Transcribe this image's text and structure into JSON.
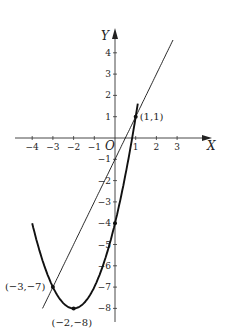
{
  "chart_data": {
    "type": "line",
    "title": "",
    "xlabel": "X",
    "ylabel": "Y",
    "origin_label": "O",
    "xlim": [
      -4,
      3
    ],
    "ylim": [
      -8,
      4
    ],
    "x_ticks": [
      "-4",
      "-3",
      "-2",
      "-1",
      "1",
      "2",
      "3"
    ],
    "y_ticks": [
      "4",
      "3",
      "2",
      "1",
      "-1",
      "-2",
      "-3",
      "-4",
      "-5",
      "-6",
      "-7",
      "-8"
    ],
    "grid": false,
    "series": [
      {
        "name": "parabola",
        "equation": "y = x^2 + 4x - 4",
        "style": "thick",
        "x_range": [
          -4.0,
          1.1
        ]
      },
      {
        "name": "line",
        "equation": "y = 2x - 1",
        "style": "thin",
        "x_range": [
          -3.5,
          2.8
        ]
      }
    ],
    "points": [
      {
        "x": 1,
        "y": 1,
        "label": "(1,1)"
      },
      {
        "x": -3,
        "y": -7,
        "label": "(−3,−7)"
      },
      {
        "x": -2,
        "y": -8,
        "label": "(−2,−8)"
      },
      {
        "x": 0,
        "y": -4,
        "label": ""
      }
    ]
  }
}
